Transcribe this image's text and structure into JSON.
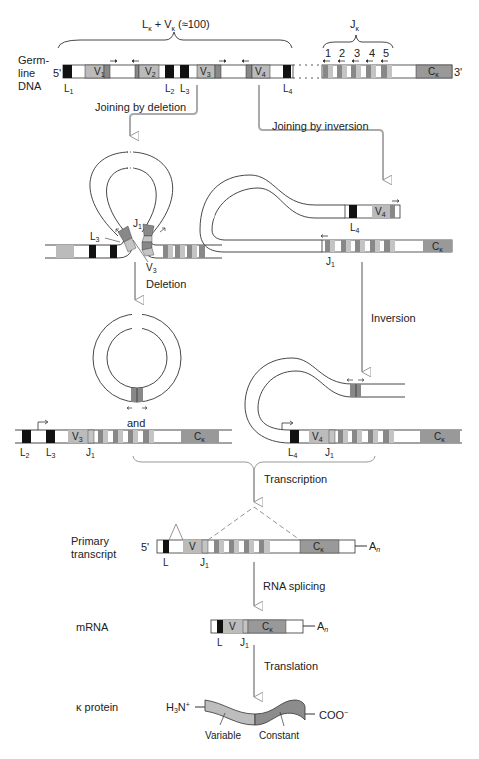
{
  "colors": {
    "leader": "#111111",
    "v_segment": "#bbbbbb",
    "j_dark": "#888888",
    "j_light": "#c4c4c4",
    "c_segment": "#999999",
    "process_arrow": "#aaaaaa",
    "variable_protein": "#bdbdbd",
    "constant_protein": "#8c8c8c"
  },
  "germline": {
    "label_line1": "Germ-",
    "label_line2": "line",
    "label_line3": "DNA",
    "five_prime": "5'",
    "three_prime": "3'",
    "brace_lv": "L",
    "brace_lv_kappa": "κ",
    "brace_lv_plus": " + V",
    "brace_lv_count": " (≈100)",
    "brace_j": "J",
    "brace_j_kappa": "κ",
    "j_numbers": [
      "1",
      "2",
      "3",
      "4",
      "5"
    ],
    "segments": {
      "L1": "L",
      "L1_sub": "1",
      "V1": "V",
      "V1_sub": "1",
      "V2": "V",
      "V2_sub": "2",
      "L2": "L",
      "L2_sub": "2",
      "L3": "L",
      "L3_sub": "3",
      "V3": "V",
      "V3_sub": "3",
      "V4": "V",
      "V4_sub": "4",
      "L4": "L",
      "L4_sub": "4",
      "C": "C",
      "C_sub": "κ"
    }
  },
  "deletion_path": {
    "joining_label": "Joining by deletion",
    "loop_labels": {
      "J1": "J",
      "J1_sub": "1",
      "L3": "L",
      "L3_sub": "3",
      "V3": "V",
      "V3_sub": "3"
    },
    "step_label": "Deletion",
    "and_label": "and",
    "result_labels": {
      "L2": "L",
      "L2_sub": "2",
      "L3": "L",
      "L3_sub": "3",
      "V3": "V",
      "V3_sub": "3",
      "J1": "J",
      "J1_sub": "1",
      "C": "C",
      "C_sub": "κ"
    }
  },
  "inversion_path": {
    "joining_label": "Joining by inversion",
    "loop_labels": {
      "L4": "L",
      "L4_sub": "4",
      "V4": "V",
      "V4_sub": "4",
      "J1": "J",
      "J1_sub": "1",
      "C": "C",
      "C_sub": "κ"
    },
    "step_label": "Inversion",
    "result_labels": {
      "L4": "L",
      "L4_sub": "4",
      "V4": "V",
      "V4_sub": "4",
      "J1": "J",
      "J1_sub": "1",
      "C": "C",
      "C_sub": "κ"
    }
  },
  "transcription": {
    "step_label": "Transcription",
    "primary_label_line1": "Primary",
    "primary_label_line2": "transcript",
    "five_prime": "5'",
    "poly_a": "A",
    "poly_a_sub": "n",
    "labels": {
      "L": "L",
      "V": "V",
      "J1": "J",
      "J1_sub": "1",
      "C": "C",
      "C_sub": "κ"
    }
  },
  "splicing": {
    "step_label": "RNA splicing",
    "mrna_label": "mRNA",
    "poly_a": "A",
    "poly_a_sub": "n",
    "labels": {
      "L": "L",
      "V": "V",
      "J1": "J",
      "J1_sub": "1",
      "C": "C",
      "C_sub": "κ"
    }
  },
  "translation": {
    "step_label": "Translation",
    "protein_label": "κ protein",
    "n_terminus": "H",
    "n_terminus_sub": "3",
    "n_terminus_rest": "N",
    "n_terminus_sup": "+",
    "c_terminus": "COO",
    "c_terminus_sup": "−",
    "variable_label": "Variable",
    "constant_label": "Constant"
  }
}
